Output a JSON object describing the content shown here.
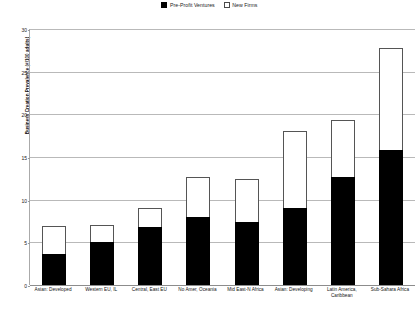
{
  "chart_data": {
    "type": "bar",
    "subtype": "stacked",
    "title": "",
    "xlabel": "",
    "ylabel": "Business Creation Prevalence (#/100 adults)",
    "ylim": [
      0,
      30
    ],
    "yticks": [
      0,
      5,
      10,
      15,
      20,
      25,
      30
    ],
    "ytick_labels": [
      "0",
      "5",
      "10",
      "15",
      "20",
      "25",
      "30"
    ],
    "grid": true,
    "legend_position": "top-center",
    "categories": [
      "Asian: Developed",
      "Western EU, IL",
      "Central, East EU",
      "No Amer, Oceania",
      "Mid East-N Africa",
      "Asian: Developing",
      "Latin America, Caribbean",
      "Sub-Sahara Africa"
    ],
    "series": [
      {
        "name": "Pre-Profit Ventures",
        "color": "#000000",
        "values": [
          3.6,
          5.0,
          6.8,
          8.0,
          7.4,
          9.0,
          12.6,
          15.8
        ]
      },
      {
        "name": "New Firms",
        "color": "#ffffff",
        "values": [
          3.3,
          2.0,
          2.2,
          4.7,
          5.0,
          9.0,
          6.7,
          12.0
        ]
      }
    ],
    "totals": [
      6.9,
      7.0,
      9.0,
      12.7,
      12.4,
      18.0,
      19.3,
      27.8
    ]
  },
  "legend": {
    "entries": [
      {
        "label": "Pre-Profit Ventures",
        "style": "filled"
      },
      {
        "label": "New Firms",
        "style": "hollow"
      }
    ]
  },
  "colors": {
    "pre_profit": "#000000",
    "new_firms": "#ffffff",
    "grid": "#b9b9b9",
    "axis": "#8c8c8c",
    "text": "#141414"
  }
}
